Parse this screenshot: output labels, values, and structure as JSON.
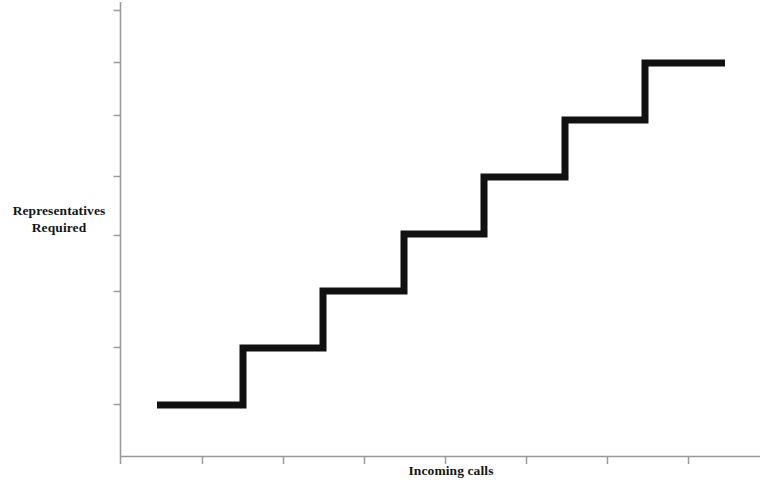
{
  "chart_data": {
    "type": "line",
    "subtype": "step",
    "title": "",
    "xlabel": "Incoming calls",
    "ylabel_lines": [
      "Representatives",
      "Required"
    ],
    "ylabel": "Representatives Required",
    "grid": false,
    "legend": null,
    "axis_color": "#9a9a9a",
    "line_color": "#111111",
    "line_width": 7,
    "x_ticks_labeled": false,
    "y_ticks_labeled": false,
    "x_tick_count": 8,
    "y_tick_count": 8,
    "xlim": [
      0,
      10
    ],
    "ylim": [
      0,
      9
    ],
    "steps": [
      {
        "index": 1,
        "x_start": 0.62,
        "x_end": 1.98,
        "y": 1
      },
      {
        "index": 2,
        "x_start": 1.98,
        "x_end": 3.26,
        "y": 2
      },
      {
        "index": 3,
        "x_start": 3.26,
        "x_end": 4.55,
        "y": 3
      },
      {
        "index": 4,
        "x_start": 4.55,
        "x_end": 5.84,
        "y": 4
      },
      {
        "index": 5,
        "x_start": 5.84,
        "x_end": 7.13,
        "y": 5
      },
      {
        "index": 6,
        "x_start": 7.13,
        "x_end": 8.41,
        "y": 6
      },
      {
        "index": 7,
        "x_start": 8.41,
        "x_end": 9.68,
        "y": 7
      }
    ],
    "x": [
      0.62,
      1.98,
      1.98,
      3.26,
      3.26,
      4.55,
      4.55,
      5.84,
      5.84,
      7.13,
      7.13,
      8.41,
      8.41,
      9.68
    ],
    "y": [
      1,
      1,
      2,
      2,
      3,
      3,
      4,
      4,
      5,
      5,
      6,
      6,
      7,
      7
    ],
    "pixel_path": "M 157,405 L 243,405 L 243,348 L 323,348 L 323,291 L 404,291 L 404,234 L 484,234 L 484,177 L 565,177 L 565,120 L 645,120 L 645,63 L 725,63",
    "axes_pixels": {
      "origin_x": 120,
      "origin_y": 456,
      "y_axis_top": 2,
      "x_axis_right": 760
    },
    "x_tick_pixels": [
      120,
      202,
      283,
      364,
      445,
      526,
      607,
      688
    ],
    "y_tick_pixels": [
      10,
      62,
      115,
      176,
      235,
      291,
      347,
      404
    ]
  }
}
